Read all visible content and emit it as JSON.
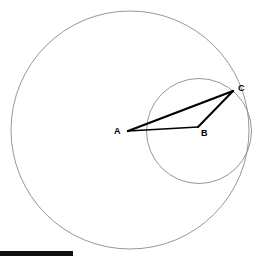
{
  "figure": {
    "background_color": "#ffffff",
    "width": 255,
    "height": 259
  },
  "labels": {
    "a": "A",
    "b": "B",
    "c": "C"
  },
  "chart_data": {
    "type": "diagram",
    "coordinate_system": "pixels, origin top-left",
    "circles": [
      {
        "name": "large-circle",
        "center_label": "A",
        "cx": 130,
        "cy": 130,
        "r": 119,
        "stroke": "#8a8a8a",
        "stroke_width": 0.9,
        "fill": "none"
      },
      {
        "name": "small-circle",
        "center_label": "B",
        "cx": 199,
        "cy": 131,
        "r": 52.5,
        "stroke": "#8a8a8a",
        "stroke_width": 0.9,
        "fill": "none"
      }
    ],
    "points": [
      {
        "label": "A",
        "x": 128,
        "y": 131,
        "role": "center of large circle"
      },
      {
        "label": "B",
        "x": 198,
        "y": 127,
        "role": "center of small circle"
      },
      {
        "label": "C",
        "x": 233,
        "y": 91,
        "role": "point on both circles"
      }
    ],
    "segments": [
      {
        "name": "AC",
        "from": "A",
        "to": "C",
        "x1": 128,
        "y1": 131,
        "x2": 233,
        "y2": 91,
        "stroke": "#000000",
        "stroke_width": 2.3
      },
      {
        "name": "BC",
        "from": "B",
        "to": "C",
        "x1": 198,
        "y1": 127,
        "x2": 233,
        "y2": 91,
        "stroke": "#000000",
        "stroke_width": 2.0
      },
      {
        "name": "AB",
        "from": "A",
        "to": "B",
        "x1": 128,
        "y1": 131,
        "x2": 198,
        "y2": 127,
        "stroke": "#000000",
        "stroke_width": 1.5
      }
    ],
    "label_positions": [
      {
        "label": "A",
        "x": 114,
        "y": 127
      },
      {
        "label": "B",
        "x": 201,
        "y": 129
      },
      {
        "label": "C",
        "x": 238,
        "y": 84
      }
    ],
    "grid": false,
    "legend": false,
    "xlabel": "",
    "ylabel": ""
  },
  "footer": {
    "bar_color": "#111111",
    "bar_x": 0,
    "bar_y": 251,
    "bar_width": 73,
    "bar_height": 5
  }
}
